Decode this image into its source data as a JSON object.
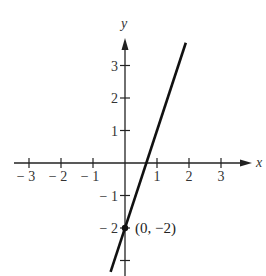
{
  "chart_data": {
    "type": "line",
    "title": "",
    "xlabel": "x",
    "ylabel": "y",
    "xlim": [
      -3.5,
      3.9
    ],
    "ylim": [
      -3.5,
      3.9
    ],
    "grid": false,
    "x_ticks": [
      -3,
      -2,
      -1,
      1,
      2,
      3
    ],
    "y_ticks": [
      -3,
      -2,
      -1,
      1,
      2,
      3
    ],
    "x_tick_labels": [
      "− 3",
      "− 2",
      "− 1",
      "1",
      "2",
      "3"
    ],
    "y_tick_labels": [
      "",
      "− 2",
      "− 1",
      "1",
      "2",
      "3"
    ],
    "series": [
      {
        "name": "line",
        "equation": "y = 3x - 2",
        "slope": 3,
        "intercept": -2,
        "x": [
          -0.45,
          1.9
        ],
        "y": [
          -3.35,
          3.7
        ]
      }
    ],
    "annotations": [
      {
        "label": "(0, −2)",
        "x": 0,
        "y": -2,
        "marker": "dot"
      }
    ]
  },
  "style": {
    "line_color": "#111111",
    "axis_color": "#222222",
    "text_color": "#333333"
  }
}
